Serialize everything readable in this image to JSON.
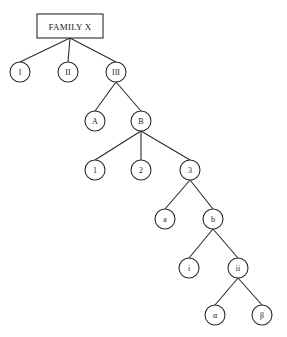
{
  "diagram": {
    "type": "tree",
    "background_color": "#ffffff",
    "line_color": "#2b2b2b",
    "node_fill_color": "#ffffff",
    "root": {
      "id": "root",
      "label": "FAMILY X",
      "shape": "rectangle",
      "x": 70,
      "y": 26,
      "width": 66,
      "height": 24
    },
    "nodes": [
      {
        "id": "n1",
        "label": "I",
        "x": 20,
        "y": 72,
        "r": 10,
        "level": 1
      },
      {
        "id": "n2",
        "label": "II",
        "x": 68,
        "y": 72,
        "r": 10,
        "level": 1
      },
      {
        "id": "n3",
        "label": "III",
        "x": 116,
        "y": 72,
        "r": 10,
        "level": 1
      },
      {
        "id": "nA",
        "label": "A",
        "x": 95,
        "y": 121,
        "r": 10,
        "level": 2
      },
      {
        "id": "nB",
        "label": "B",
        "x": 141,
        "y": 121,
        "r": 10,
        "level": 2
      },
      {
        "id": "nOne",
        "label": "1",
        "x": 95,
        "y": 170,
        "r": 10,
        "level": 3
      },
      {
        "id": "nTwo",
        "label": "2",
        "x": 141,
        "y": 170,
        "r": 10,
        "level": 3
      },
      {
        "id": "nThree",
        "label": "3",
        "x": 190,
        "y": 170,
        "r": 10,
        "level": 3
      },
      {
        "id": "na",
        "label": "a",
        "x": 165,
        "y": 219,
        "r": 10,
        "level": 4
      },
      {
        "id": "nb",
        "label": "b",
        "x": 213,
        "y": 219,
        "r": 10,
        "level": 4
      },
      {
        "id": "ni",
        "label": "i",
        "x": 189,
        "y": 268,
        "r": 10,
        "level": 5
      },
      {
        "id": "nii",
        "label": "ii",
        "x": 238,
        "y": 268,
        "r": 10,
        "level": 5
      },
      {
        "id": "nalpha",
        "label": "α",
        "x": 215,
        "y": 315,
        "r": 10,
        "level": 6
      },
      {
        "id": "nbeta",
        "label": "β",
        "x": 262,
        "y": 315,
        "r": 10,
        "level": 6
      }
    ],
    "edges": [
      {
        "from": "root",
        "to": "n1"
      },
      {
        "from": "root",
        "to": "n2"
      },
      {
        "from": "root",
        "to": "n3"
      },
      {
        "from": "n3",
        "to": "nA"
      },
      {
        "from": "n3",
        "to": "nB"
      },
      {
        "from": "nB",
        "to": "nOne"
      },
      {
        "from": "nB",
        "to": "nTwo"
      },
      {
        "from": "nB",
        "to": "nThree"
      },
      {
        "from": "nThree",
        "to": "na"
      },
      {
        "from": "nThree",
        "to": "nb"
      },
      {
        "from": "nb",
        "to": "ni"
      },
      {
        "from": "nb",
        "to": "nii"
      },
      {
        "from": "nii",
        "to": "nalpha"
      },
      {
        "from": "nii",
        "to": "nbeta"
      }
    ]
  }
}
